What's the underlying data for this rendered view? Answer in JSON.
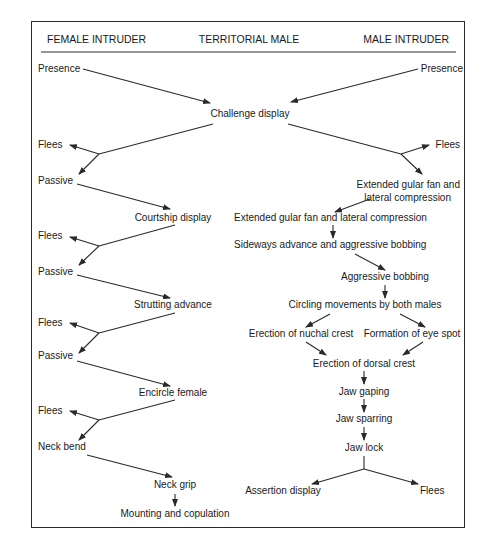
{
  "diagram": {
    "type": "flowchart",
    "headers": {
      "left": "FEMALE INTRUDER",
      "center": "TERRITORIAL MALE",
      "right": "MALE INTRUDER"
    },
    "nodes": {
      "presence_female": "Presence",
      "presence_male": "Presence",
      "challenge_display": "Challenge display",
      "flees_f1": "Flees",
      "passive_f1": "Passive",
      "flees_m1": "Flees",
      "extended_gular_intruder_line1": "Extended gular fan and",
      "extended_gular_intruder_line2": "lateral compression",
      "courtship_display": "Courtship display",
      "extended_gular_territorial": "Extended gular fan and lateral compression",
      "flees_f2": "Flees",
      "sideways_advance": "Sideways advance and aggressive bobbing",
      "passive_f2": "Passive",
      "aggressive_bobbing": "Aggressive bobbing",
      "strutting_advance": "Strutting advance",
      "circling_movements": "Circling movements by both males",
      "flees_f3": "Flees",
      "erection_nuchal_crest": "Erection of nuchal crest",
      "formation_eye_spot": "Formation of eye spot",
      "passive_f3": "Passive",
      "erection_dorsal_crest": "Erection of dorsal crest",
      "encircle_female": "Encircle female",
      "jaw_gaping": "Jaw gaping",
      "flees_f4": "Flees",
      "jaw_sparring": "Jaw sparring",
      "neck_bend": "Neck bend",
      "jaw_lock": "Jaw lock",
      "neck_grip": "Neck grip",
      "assertion_display": "Assertion display",
      "flees_m2": "Flees",
      "mounting_copulation": "Mounting and copulation"
    },
    "colors": {
      "line": "#2a2a2a",
      "text": "#1a1a1a",
      "background": "#ffffff"
    }
  }
}
